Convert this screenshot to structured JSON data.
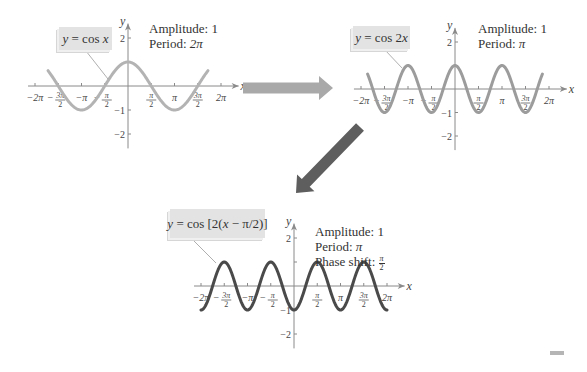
{
  "graphs": [
    {
      "id": "cos-x",
      "equation": {
        "prefix": "y",
        "eq": " = cos ",
        "arg": "x"
      },
      "amplitude_label": "Amplitude:",
      "amplitude_value": "1",
      "period_label": "Period:",
      "period_value": "2π",
      "origin": [
        128,
        86
      ],
      "px_per_pi": 46.5,
      "px_per_unit": 24,
      "curve_color": "#b3b3b3",
      "curve_width": 3,
      "func": {
        "a": 1,
        "b": 1,
        "c": 0
      },
      "x_range_pi": [
        -1.72,
        1.72
      ]
    },
    {
      "id": "cos-2x",
      "equation": {
        "prefix": "y",
        "eq": " = cos 2",
        "arg": "x"
      },
      "amplitude_label": "Amplitude:",
      "amplitude_value": "1",
      "period_label": "Period:",
      "period_value": "π",
      "origin": [
        455,
        89
      ],
      "px_per_pi": 47,
      "px_per_unit": 23.5,
      "curve_color": "#9c9c9c",
      "curve_width": 3,
      "func": {
        "a": 1,
        "b": 2,
        "c": 0
      },
      "x_range_pi": [
        -1.86,
        1.86
      ]
    },
    {
      "id": "cos-2-x-minus-pi-over-2",
      "equation": {
        "prefix": "y",
        "eq": " = cos [2(",
        "arg": "x",
        "suffix": " − π/2)]"
      },
      "amplitude_label": "Amplitude:",
      "amplitude_value": "1",
      "period_label": "Period:",
      "period_value": "π",
      "phase_label": "Phase shift:",
      "phase_value": {
        "num": "π",
        "den": "2"
      },
      "origin": [
        294,
        286
      ],
      "px_per_pi": 46.5,
      "px_per_unit": 24,
      "curve_color": "#4a4a4a",
      "curve_width": 3,
      "func": {
        "a": 1,
        "b": 2,
        "c": 1.5708
      },
      "x_range_pi": [
        -2,
        2
      ]
    }
  ],
  "axis": {
    "x_label": "x",
    "y_label": "y",
    "x_ticks": [
      {
        "pos_pi": -2,
        "label": "−2π"
      },
      {
        "pos_pi": -1.5,
        "label": "−3π/2",
        "num": "3π",
        "den": "2",
        "neg": true
      },
      {
        "pos_pi": -1,
        "label": "−π"
      },
      {
        "pos_pi": -0.5,
        "label": "−π/2",
        "num": "π",
        "den": "2",
        "neg": true
      },
      {
        "pos_pi": 0.5,
        "label": "π/2",
        "num": "π",
        "den": "2"
      },
      {
        "pos_pi": 1,
        "label": "π"
      },
      {
        "pos_pi": 1.5,
        "label": "3π/2",
        "num": "3π",
        "den": "2"
      },
      {
        "pos_pi": 2,
        "label": "2π"
      }
    ],
    "y_ticks": [
      {
        "value": 2,
        "label": "2"
      },
      {
        "value": 1,
        "label": ""
      },
      {
        "value": -1,
        "label": "−1"
      },
      {
        "value": -2,
        "label": "−2"
      }
    ],
    "color": "#8a8a8a"
  },
  "arrows": [
    {
      "name": "right-arrow",
      "from": [
        243,
        88
      ],
      "to": [
        333,
        88
      ],
      "color": "#a9a9a9",
      "width": 11
    },
    {
      "name": "down-left-arrow",
      "from": [
        360,
        127
      ],
      "to": [
        296,
        193
      ],
      "color": "#5e5e5e",
      "width": 11
    }
  ],
  "label_boxes": [
    {
      "graph": 0,
      "box": [
        59,
        27,
        53,
        23
      ],
      "callout": [
        [
          86,
          51
        ],
        [
          108,
          79
        ]
      ]
    },
    {
      "graph": 1,
      "box": [
        353,
        26,
        57,
        23
      ],
      "callout": [
        [
          385,
          50
        ],
        [
          402,
          68
        ]
      ]
    },
    {
      "graph": 2,
      "box": [
        170,
        209,
        95,
        29
      ],
      "callout": [
        [
          193,
          240
        ],
        [
          216,
          263
        ]
      ]
    }
  ],
  "info_positions": [
    [
      149,
      21
    ],
    [
      478,
      21
    ],
    [
      315,
      224
    ]
  ]
}
